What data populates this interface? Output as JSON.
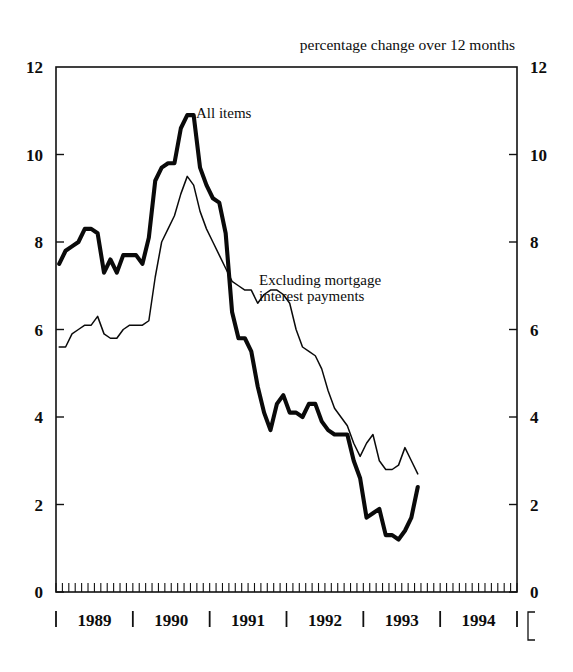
{
  "chart_data": {
    "type": "line",
    "title": "percentage change over 12 months",
    "xlabel": "",
    "ylabel": "",
    "ylim": [
      0,
      12
    ],
    "yticks": [
      0,
      2,
      4,
      6,
      8,
      10,
      12
    ],
    "ytick_labels": [
      "0",
      "2",
      "4",
      "6",
      "8",
      "10",
      "12"
    ],
    "right_axis_labels": [
      "0",
      "2",
      "4",
      "6",
      "8",
      "10",
      "12"
    ],
    "xlim": [
      "1989-01",
      "1994-12"
    ],
    "xtick_labels": [
      "1989",
      "1990",
      "1991",
      "1992",
      "1993",
      "1994"
    ],
    "grid": false,
    "legend_position": "inline-annotation",
    "minor_tick_interval_months": 1,
    "annotations": [
      {
        "text": "All items",
        "x": "1990-04",
        "y": 11.3
      },
      {
        "text": "Excluding mortgage",
        "x": "1991-03",
        "y": 7.1
      },
      {
        "text": "interest payments",
        "x": "1991-03",
        "y": 6.6
      }
    ],
    "series": [
      {
        "name": "All items",
        "style": "thick",
        "x": [
          "1989-01",
          "1989-02",
          "1989-03",
          "1989-04",
          "1989-05",
          "1989-06",
          "1989-07",
          "1989-08",
          "1989-09",
          "1989-10",
          "1989-11",
          "1989-12",
          "1990-01",
          "1990-02",
          "1990-03",
          "1990-04",
          "1990-05",
          "1990-06",
          "1990-07",
          "1990-08",
          "1990-09",
          "1990-10",
          "1990-11",
          "1990-12",
          "1991-01",
          "1991-02",
          "1991-03",
          "1991-04",
          "1991-05",
          "1991-06",
          "1991-07",
          "1991-08",
          "1991-09",
          "1991-10",
          "1991-11",
          "1991-12",
          "1992-01",
          "1992-02",
          "1992-03",
          "1992-04",
          "1992-05",
          "1992-06",
          "1992-07",
          "1992-08",
          "1992-09",
          "1992-10",
          "1992-11",
          "1992-12",
          "1993-01",
          "1993-02",
          "1993-03",
          "1993-04",
          "1993-05",
          "1993-06",
          "1993-07",
          "1993-08",
          "1993-09"
        ],
        "values": [
          7.5,
          7.8,
          7.9,
          8.0,
          8.3,
          8.3,
          8.2,
          7.3,
          7.6,
          7.3,
          7.7,
          7.7,
          7.7,
          7.5,
          8.1,
          9.4,
          9.7,
          9.8,
          9.8,
          10.6,
          10.9,
          10.9,
          9.7,
          9.3,
          9.0,
          8.9,
          8.2,
          6.4,
          5.8,
          5.8,
          5.5,
          4.7,
          4.1,
          3.7,
          4.3,
          4.5,
          4.1,
          4.1,
          4.0,
          4.3,
          4.3,
          3.9,
          3.7,
          3.6,
          3.6,
          3.6,
          3.0,
          2.6,
          1.7,
          1.8,
          1.9,
          1.3,
          1.3,
          1.2,
          1.4,
          1.7,
          2.4
        ]
      },
      {
        "name": "Excluding mortgage interest payments",
        "style": "thin",
        "x": [
          "1989-01",
          "1989-02",
          "1989-03",
          "1989-04",
          "1989-05",
          "1989-06",
          "1989-07",
          "1989-08",
          "1989-09",
          "1989-10",
          "1989-11",
          "1989-12",
          "1990-01",
          "1990-02",
          "1990-03",
          "1990-04",
          "1990-05",
          "1990-06",
          "1990-07",
          "1990-08",
          "1990-09",
          "1990-10",
          "1990-11",
          "1990-12",
          "1991-01",
          "1991-02",
          "1991-03",
          "1991-04",
          "1991-05",
          "1991-06",
          "1991-07",
          "1991-08",
          "1991-09",
          "1991-10",
          "1991-11",
          "1991-12",
          "1992-01",
          "1992-02",
          "1992-03",
          "1992-04",
          "1992-05",
          "1992-06",
          "1992-07",
          "1992-08",
          "1992-09",
          "1992-10",
          "1992-11",
          "1992-12",
          "1993-01",
          "1993-02",
          "1993-03",
          "1993-04",
          "1993-05",
          "1993-06",
          "1993-07",
          "1993-08",
          "1993-09"
        ],
        "values": [
          5.6,
          5.6,
          5.9,
          6.0,
          6.1,
          6.1,
          6.3,
          5.9,
          5.8,
          5.8,
          6.0,
          6.1,
          6.1,
          6.1,
          6.2,
          7.2,
          8.0,
          8.3,
          8.6,
          9.1,
          9.5,
          9.3,
          8.7,
          8.3,
          8.0,
          7.7,
          7.4,
          7.1,
          7.0,
          6.9,
          6.9,
          6.6,
          6.8,
          6.9,
          6.9,
          6.8,
          6.6,
          6.0,
          5.6,
          5.5,
          5.4,
          5.1,
          4.6,
          4.2,
          4.0,
          3.8,
          3.4,
          3.1,
          3.4,
          3.6,
          3.0,
          2.8,
          2.8,
          2.9,
          3.3,
          3.0,
          2.7
        ]
      }
    ]
  },
  "axis": {
    "left_labels": [
      "12",
      "10",
      "8",
      "6",
      "4",
      "2",
      "0"
    ],
    "right_labels": [
      "12",
      "10",
      "8",
      "6",
      "4",
      "2",
      "0"
    ],
    "years": [
      "1989",
      "1990",
      "1991",
      "1992",
      "1993",
      "1994"
    ]
  }
}
